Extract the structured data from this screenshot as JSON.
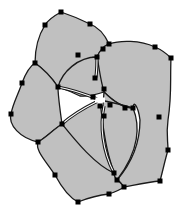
{
  "diagram": {
    "title": "",
    "type": "petal-mesh",
    "colors": {
      "background": "#ffffff",
      "fill": "#c0c0c0",
      "stroke": "#1a1a1a",
      "node": "#000000",
      "highlight": "#ffffff"
    },
    "regions": [
      {
        "name": "top-petal",
        "path": "M61,12 C52,17 48,20 45,25 C40,33 35,45 35,63 C45,70 52,78 58,87 C70,70 85,57 97,57 C100,50 103,46 109,44 C104,33 98,27 90,24 C80,19 70,15 61,12 Z"
      },
      {
        "name": "right-petal",
        "path": "M109,44 C120,40 140,40 155,47 C162,50 167,54 171,58 C170,80 172,95 168,120 C166,135 168,140 168,150 C165,160 163,170 160,181 C148,182 135,185 124,187 C120,182 118,180 117,180 C130,165 140,145 140,120 C138,105 133,100 133,108 C125,108 115,103 104,92 C99,80 97,65 97,57 C100,50 103,46 109,44 Z"
      },
      {
        "name": "left-petal",
        "path": "M35,63 C30,66 25,75 22,83 C18,95 13,103 11,114 C8,125 20,138 38,142 C45,138 53,130 62,124 C60,110 58,95 58,87 C52,78 45,70 35,63 Z"
      },
      {
        "name": "bottom-petal",
        "path": "M38,142 C35,150 45,160 55,175 C62,188 70,198 78,202 C88,198 98,195 109,194 C115,192 120,190 124,187 C120,182 118,180 117,180 C115,177 114,175 114,173 C100,165 85,150 78,140 C72,132 66,127 62,124 C53,130 45,138 38,142 Z"
      },
      {
        "name": "center-left-lobe",
        "path": "M58,87 C62,72 78,57 97,57 C99,66 100,78 104,92 C95,95 88,97 80,96 C72,92 64,89 58,87 Z"
      },
      {
        "name": "center-right-lobe",
        "path": "M104,92 C115,103 125,108 133,108 C140,125 140,150 117,180 C112,175 110,160 104,140 C100,125 103,108 104,92 Z"
      },
      {
        "name": "center-lower-lobe",
        "path": "M62,124 C75,112 90,105 100,100 C102,120 104,140 110,160 C112,167 113,170 114,173 C95,165 75,140 62,124 Z"
      }
    ],
    "edges": [
      {
        "name": "inner-arc-upper",
        "path": "M58,87 C75,90 90,96 100,100",
        "double": true
      },
      {
        "name": "inner-arc-lower",
        "path": "M62,124 C75,112 90,105 100,100",
        "double": true
      },
      {
        "name": "inner-vertical",
        "path": "M97,57 C97,70 96,80 95,78",
        "double": true
      },
      {
        "name": "inner-right",
        "path": "M100,100 C110,102 120,104 133,108",
        "double": false
      },
      {
        "name": "inner-down",
        "path": "M104,106 C100,125 102,150 114,173",
        "double": true
      }
    ],
    "nodes": [
      {
        "x": 61,
        "y": 12
      },
      {
        "x": 45,
        "y": 25
      },
      {
        "x": 90,
        "y": 24
      },
      {
        "x": 109,
        "y": 44
      },
      {
        "x": 103,
        "y": 49
      },
      {
        "x": 97,
        "y": 57
      },
      {
        "x": 35,
        "y": 63
      },
      {
        "x": 155,
        "y": 47
      },
      {
        "x": 171,
        "y": 58
      },
      {
        "x": 78,
        "y": 55
      },
      {
        "x": 22,
        "y": 83
      },
      {
        "x": 58,
        "y": 87
      },
      {
        "x": 95,
        "y": 78
      },
      {
        "x": 104,
        "y": 89
      },
      {
        "x": 11,
        "y": 114
      },
      {
        "x": 62,
        "y": 124
      },
      {
        "x": 38,
        "y": 142
      },
      {
        "x": 125,
        "y": 108
      },
      {
        "x": 133,
        "y": 108
      },
      {
        "x": 159,
        "y": 117
      },
      {
        "x": 168,
        "y": 150
      },
      {
        "x": 160,
        "y": 181
      },
      {
        "x": 104,
        "y": 116
      },
      {
        "x": 114,
        "y": 173
      },
      {
        "x": 117,
        "y": 180
      },
      {
        "x": 124,
        "y": 187
      },
      {
        "x": 109,
        "y": 194
      },
      {
        "x": 78,
        "y": 202
      },
      {
        "x": 55,
        "y": 175
      },
      {
        "x": 93,
        "y": 97
      },
      {
        "x": 110,
        "y": 105
      },
      {
        "x": 100,
        "y": 106
      }
    ],
    "center_marker": {
      "x": 100,
      "y": 100,
      "size": 8
    }
  }
}
